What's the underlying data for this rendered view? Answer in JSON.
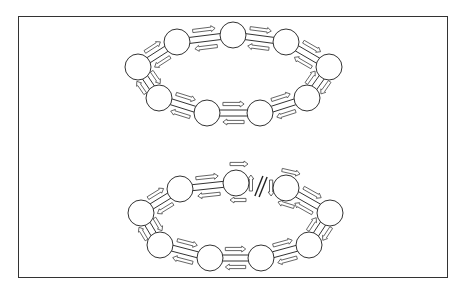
{
  "figure": {
    "colors": {
      "stroke": "#333333",
      "fill": "#ffffff",
      "arrow_stroke": "#555555"
    },
    "rings": [
      {
        "name": "closed-ring",
        "state": "closed",
        "nodes": [
          [
            138,
            67
          ],
          [
            177,
            42
          ],
          [
            233,
            35
          ],
          [
            286,
            42
          ],
          [
            329,
            67
          ],
          [
            307,
            98
          ],
          [
            260,
            113
          ],
          [
            207,
            113
          ],
          [
            159,
            98
          ]
        ],
        "radius": 13,
        "broken_between": null
      },
      {
        "name": "broken-ring",
        "state": "open",
        "nodes": [
          [
            141,
            213
          ],
          [
            180,
            189
          ],
          [
            236,
            183
          ],
          [
            286,
            188
          ],
          [
            330,
            213
          ],
          [
            309,
            245
          ],
          [
            261,
            258
          ],
          [
            210,
            258
          ],
          [
            160,
            245
          ]
        ],
        "radius": 13,
        "broken_between": [
          2,
          3
        ]
      }
    ]
  }
}
